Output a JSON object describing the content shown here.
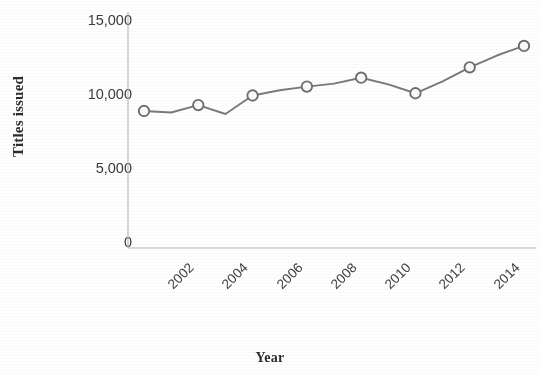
{
  "chart_data": {
    "type": "line",
    "title": "",
    "xlabel": "Year",
    "ylabel": "Titles issued",
    "x": [
      2002,
      2003,
      2004,
      2005,
      2006,
      2007,
      2008,
      2009,
      2010,
      2011,
      2012,
      2013,
      2014,
      2015,
      2016
    ],
    "values": [
      8850,
      8750,
      9250,
      8650,
      9900,
      10250,
      10500,
      10700,
      11100,
      10650,
      10050,
      10850,
      11800,
      12600,
      13250
    ],
    "marker_years": [
      2002,
      2004,
      2006,
      2008,
      2010,
      2012,
      2014,
      2016
    ],
    "marker_values": [
      8850,
      9250,
      9900,
      10500,
      11100,
      10050,
      11800,
      13250
    ],
    "xtick_labels": [
      "2002",
      "2004",
      "2006",
      "2008",
      "2010",
      "2012",
      "2014",
      "2016"
    ],
    "ytick_labels": [
      "0",
      "5,000",
      "10,000",
      "15,000"
    ],
    "ytick_values": [
      0,
      5000,
      10000,
      15000
    ],
    "ylim": [
      0,
      15000
    ],
    "xlim": [
      2002,
      2016
    ],
    "grid": false,
    "legend": null,
    "line_color": "#7a7a7a",
    "marker_fill": "#ffffff",
    "marker_edge": "#6f6f6f",
    "axis_color": "#b9b9b9",
    "text_color": "#3a3a3a"
  }
}
